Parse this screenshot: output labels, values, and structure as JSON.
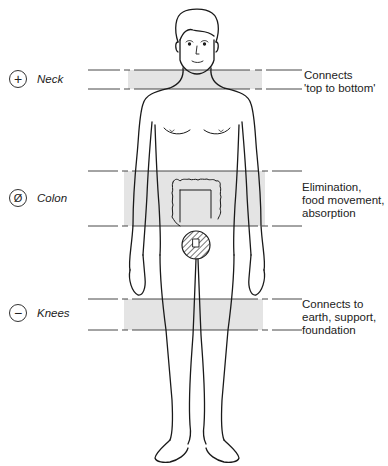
{
  "diagram": {
    "type": "body-zone-diagram",
    "zones": [
      {
        "id": "neck",
        "symbol": "+",
        "symbol_name": "plus-icon",
        "name": "Neck",
        "description": "Connects\n'top to bottom'",
        "band_top": 70,
        "band_bottom": 89
      },
      {
        "id": "colon",
        "symbol": "Ø",
        "symbol_name": "neutral-icon",
        "name": "Colon",
        "description": "Elimination,\nfood movement,\nabsorption",
        "band_top": 171,
        "band_bottom": 226
      },
      {
        "id": "knees",
        "symbol": "−",
        "symbol_name": "minus-icon",
        "name": "Knees",
        "description": "Connects to\nearth, support,\nfoundation",
        "band_top": 299,
        "band_bottom": 330
      }
    ],
    "colors": {
      "band_fill": "#e4e4e4",
      "line": "#333333",
      "figure_stroke": "#1a1a1a"
    }
  }
}
